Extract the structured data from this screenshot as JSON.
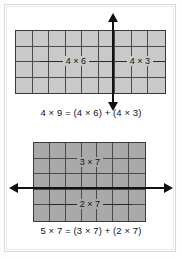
{
  "page": {
    "background_color": "#ffffff",
    "frame_color": "#d8d8d8"
  },
  "figures": [
    {
      "id": "distributive-property-4x9",
      "grid": {
        "columns": 9,
        "rows": 4,
        "fill_color": "#c9c9c9",
        "line_color": "#4a4a4a"
      },
      "split": {
        "orientation": "vertical",
        "after_column": 6,
        "arrow": "double-headed",
        "arrow_color": "#111111"
      },
      "labels": {
        "left": "4 × 6",
        "right": "4 × 3"
      },
      "caption": "4 × 9 = (4 × 6) + (4 × 3)"
    },
    {
      "id": "distributive-property-5x7",
      "grid": {
        "columns": 7,
        "rows": 5,
        "fill_color": "#a9a9a9",
        "line_color": "#4a4a4a"
      },
      "split": {
        "orientation": "horizontal",
        "after_row": 3,
        "arrow": "double-headed",
        "arrow_color": "#111111"
      },
      "labels": {
        "top": "3 × 7",
        "bottom": "2 × 7"
      },
      "caption": "5 × 7 = (3 × 7) + (2 × 7)"
    }
  ]
}
